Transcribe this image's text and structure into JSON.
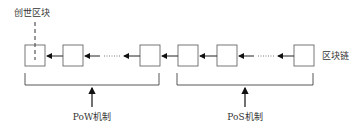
{
  "labels": {
    "genesis_block": "创世区块",
    "blockchain": "区块链",
    "pow_mechanism": "PoW机制",
    "pos_mechanism": "PoS机制"
  },
  "blocks": [
    {
      "group": "PoW",
      "role": "genesis"
    },
    {
      "group": "PoW",
      "role": "block"
    },
    {
      "group": "PoW",
      "role": "block"
    },
    {
      "group": "PoS",
      "role": "block"
    },
    {
      "group": "PoS",
      "role": "block"
    },
    {
      "group": "PoS",
      "role": "block"
    }
  ],
  "ellipsis": "……",
  "colors": {
    "stroke": "#555555",
    "arrow": "#111111",
    "text": "#333333"
  }
}
